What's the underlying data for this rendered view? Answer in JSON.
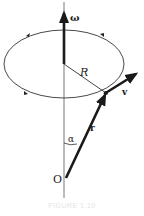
{
  "diagram": {
    "labels": {
      "omega": "ω",
      "radius": "R",
      "velocity": "v",
      "position": "r",
      "angle": "α",
      "origin": "O"
    },
    "caption": "FIGURE 1.10",
    "colors": {
      "stroke": "#1a1a1a",
      "axis": "#555555",
      "background": "#ffffff"
    }
  }
}
